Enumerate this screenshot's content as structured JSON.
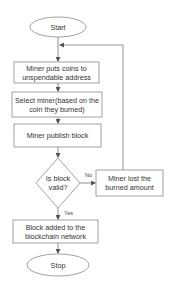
{
  "diagram": {
    "type": "flowchart",
    "colors": {
      "stroke": "#8a8a8a",
      "text": "#333333",
      "background": "#ffffff"
    },
    "nodes": {
      "start": {
        "shape": "oval",
        "label": "Start"
      },
      "puts_coins": {
        "shape": "rect",
        "label": "Miner puts coins to unspendable address"
      },
      "select_miner": {
        "shape": "rect",
        "label": "Select miner(based on the coin they burned)"
      },
      "publish": {
        "shape": "rect",
        "label": "Miner publish block"
      },
      "valid": {
        "shape": "diamond",
        "label": "Is block valid?"
      },
      "lost": {
        "shape": "rect",
        "label": "Miner lost the burned amount"
      },
      "added": {
        "shape": "rect",
        "label": "Block added to the blockchain network"
      },
      "stop": {
        "shape": "oval",
        "label": "Stop"
      }
    },
    "edges": [
      {
        "from": "start",
        "to": "puts_coins",
        "label": ""
      },
      {
        "from": "puts_coins",
        "to": "select_miner",
        "label": ""
      },
      {
        "from": "select_miner",
        "to": "publish",
        "label": ""
      },
      {
        "from": "publish",
        "to": "valid",
        "label": ""
      },
      {
        "from": "valid",
        "to": "lost",
        "label": "No"
      },
      {
        "from": "lost",
        "to": "puts_coins",
        "label": ""
      },
      {
        "from": "valid",
        "to": "added",
        "label": "Yes"
      },
      {
        "from": "added",
        "to": "stop",
        "label": ""
      }
    ],
    "edge_labels": {
      "no": "No",
      "yes": "Yes"
    }
  }
}
